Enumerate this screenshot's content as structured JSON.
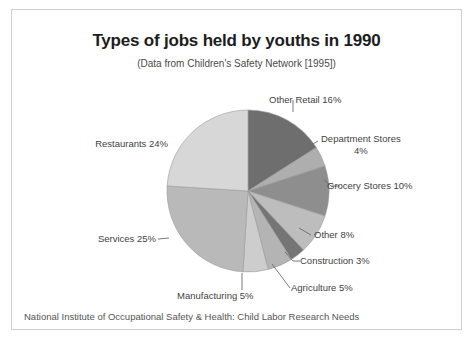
{
  "frame": {
    "border_color": "#cfcfcf"
  },
  "header": {
    "title": "Types of jobs held by youths in 1990",
    "subtitle": "(Data from Children's Safety Network [1995])"
  },
  "footer": {
    "note": "National Institute of Occupational Safety & Health: Child Labor Research Needs"
  },
  "chart_data": {
    "type": "pie",
    "title": "Types of jobs held by youths in 1990",
    "subtitle": "(Data from Children's Safety Network [1995])",
    "source_note": "National Institute of Occupational Safety & Health: Child Labor Research Needs",
    "units": "percent",
    "start_angle_deg": 0,
    "direction": "clockwise",
    "legend": "none (direct labels with leader lines)",
    "grid": false,
    "total": 100,
    "categories": [
      "Other Retail",
      "Department Stores",
      "Grocery Stores",
      "Other",
      "Construction",
      "Agriculture",
      "Manufacturing",
      "Services",
      "Restaurants"
    ],
    "values": [
      16,
      4,
      10,
      8,
      3,
      5,
      5,
      25,
      24
    ],
    "slices": [
      {
        "label": "Other Retail",
        "value": 16,
        "label_text": "Other Retail 16%",
        "color": "#6e6e6e"
      },
      {
        "label": "Department Stores",
        "value": 4,
        "label_text": "Department Stores",
        "label_text2": "4%",
        "color": "#aeaeae"
      },
      {
        "label": "Grocery Stores",
        "value": 10,
        "label_text": "Grocery Stores  10%",
        "color": "#8e8e8e"
      },
      {
        "label": "Other",
        "value": 8,
        "label_text": "Other  8%",
        "color": "#bdbdbd"
      },
      {
        "label": "Construction",
        "value": 3,
        "label_text": "Construction 3%",
        "color": "#757575"
      },
      {
        "label": "Agriculture",
        "value": 5,
        "label_text": "Agriculture  5%",
        "color": "#b4b4b4"
      },
      {
        "label": "Manufacturing",
        "value": 5,
        "label_text": "Manufacturing 5%",
        "color": "#cdcdcd"
      },
      {
        "label": "Services",
        "value": 25,
        "label_text": "Services  25%",
        "color": "#b9b9b9"
      },
      {
        "label": "Restaurants",
        "value": 24,
        "label_text": "Restaurants  24%",
        "color": "#d7d7d7"
      }
    ]
  }
}
